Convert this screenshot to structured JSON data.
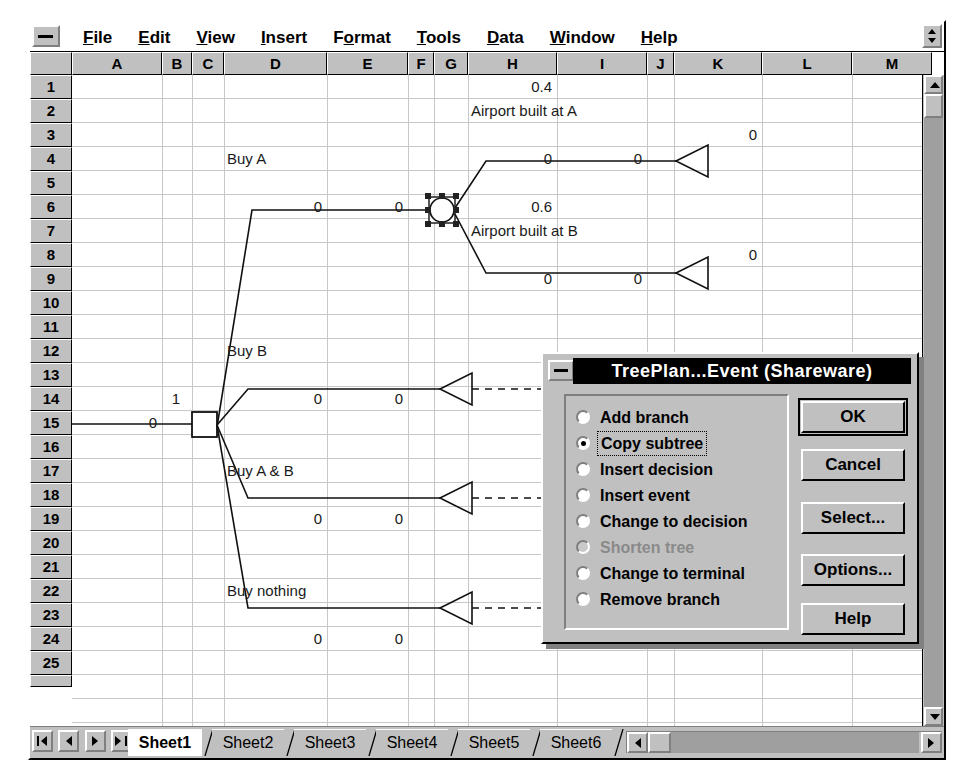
{
  "window": {
    "system_menu_icon": "minimize-bar-icon",
    "menus": [
      {
        "label": "File",
        "accel": "F"
      },
      {
        "label": "Edit",
        "accel": "E"
      },
      {
        "label": "View",
        "accel": "V"
      },
      {
        "label": "Insert",
        "accel": "I"
      },
      {
        "label": "Format",
        "accel": "o"
      },
      {
        "label": "Tools",
        "accel": "T"
      },
      {
        "label": "Data",
        "accel": "D"
      },
      {
        "label": "Window",
        "accel": "W"
      },
      {
        "label": "Help",
        "accel": "H"
      }
    ]
  },
  "grid": {
    "columns": [
      {
        "label": "A",
        "x": 42,
        "w": 90
      },
      {
        "label": "B",
        "x": 132,
        "w": 30
      },
      {
        "label": "C",
        "x": 162,
        "w": 32
      },
      {
        "label": "D",
        "x": 194,
        "w": 103
      },
      {
        "label": "E",
        "x": 297,
        "w": 81
      },
      {
        "label": "F",
        "x": 378,
        "w": 26
      },
      {
        "label": "G",
        "x": 404,
        "w": 34
      },
      {
        "label": "H",
        "x": 438,
        "w": 89
      },
      {
        "label": "I",
        "x": 527,
        "w": 90
      },
      {
        "label": "J",
        "x": 617,
        "w": 27
      },
      {
        "label": "K",
        "x": 644,
        "w": 88
      },
      {
        "label": "L",
        "x": 732,
        "w": 90
      },
      {
        "label": "M",
        "x": 822,
        "w": 80
      }
    ],
    "rows": [
      "1",
      "2",
      "3",
      "4",
      "5",
      "6",
      "7",
      "8",
      "9",
      "10",
      "11",
      "12",
      "13",
      "14",
      "15",
      "16",
      "17",
      "18",
      "19",
      "20",
      "21",
      "22",
      "23",
      "24",
      "25"
    ],
    "cells": [
      {
        "text": "0.4",
        "col": "H",
        "row": 1,
        "align": "r"
      },
      {
        "text": "Airport built at A",
        "col": "H",
        "row": 2,
        "align": "l"
      },
      {
        "text": "0",
        "col": "K",
        "row": 3,
        "align": "r"
      },
      {
        "text": "Buy A",
        "col": "D",
        "row": 4,
        "align": "l"
      },
      {
        "text": "0",
        "col": "H",
        "row": 4,
        "align": "r"
      },
      {
        "text": "0",
        "col": "I",
        "row": 4,
        "align": "r"
      },
      {
        "text": "0",
        "col": "D",
        "row": 6,
        "align": "r"
      },
      {
        "text": "0",
        "col": "E",
        "row": 6,
        "align": "r"
      },
      {
        "text": "0.6",
        "col": "H",
        "row": 6,
        "align": "r"
      },
      {
        "text": "Airport built at B",
        "col": "H",
        "row": 7,
        "align": "l"
      },
      {
        "text": "0",
        "col": "K",
        "row": 8,
        "align": "r"
      },
      {
        "text": "0",
        "col": "H",
        "row": 9,
        "align": "r"
      },
      {
        "text": "0",
        "col": "I",
        "row": 9,
        "align": "r"
      },
      {
        "text": "Buy B",
        "col": "D",
        "row": 12,
        "align": "l"
      },
      {
        "text": "1",
        "col": "B",
        "row": 14,
        "align": "c"
      },
      {
        "text": "0",
        "col": "D",
        "row": 14,
        "align": "r"
      },
      {
        "text": "0",
        "col": "E",
        "row": 14,
        "align": "r"
      },
      {
        "text": "0",
        "col": "A",
        "row": 15,
        "align": "r"
      },
      {
        "text": "Buy A & B",
        "col": "D",
        "row": 17,
        "align": "l"
      },
      {
        "text": "0",
        "col": "D",
        "row": 19,
        "align": "r"
      },
      {
        "text": "0",
        "col": "E",
        "row": 19,
        "align": "r"
      },
      {
        "text": "Buy nothing",
        "col": "D",
        "row": 22,
        "align": "l"
      },
      {
        "text": "0",
        "col": "D",
        "row": 24,
        "align": "r"
      },
      {
        "text": "0",
        "col": "E",
        "row": 24,
        "align": "r"
      }
    ]
  },
  "tree": {
    "decision_node_label": "1",
    "event_node_label": "",
    "branch_labels": [
      "Buy A",
      "Buy B",
      "Buy A & B",
      "Buy nothing"
    ],
    "event_branch_labels": [
      "Airport built at A",
      "Airport built at B"
    ],
    "probabilities": [
      "0.4",
      "0.6"
    ],
    "selected_node": "event-node"
  },
  "tabbar": {
    "nav_buttons": [
      "first-sheet-icon",
      "prev-sheet-icon",
      "next-sheet-icon",
      "last-sheet-icon"
    ],
    "sheets": [
      {
        "label": "Sheet1",
        "active": true
      },
      {
        "label": "Sheet2",
        "active": false
      },
      {
        "label": "Sheet3",
        "active": false
      },
      {
        "label": "Sheet4",
        "active": false
      },
      {
        "label": "Sheet5",
        "active": false
      },
      {
        "label": "Sheet6",
        "active": false
      }
    ]
  },
  "dialog": {
    "title": "TreePlan...Event (Shareware)",
    "system_menu_icon": "minimize-bar-icon",
    "options": [
      {
        "label": "Add branch",
        "selected": false,
        "disabled": false,
        "focused": false
      },
      {
        "label": "Copy subtree",
        "selected": true,
        "disabled": false,
        "focused": true
      },
      {
        "label": "Insert decision",
        "selected": false,
        "disabled": false,
        "focused": false
      },
      {
        "label": "Insert event",
        "selected": false,
        "disabled": false,
        "focused": false
      },
      {
        "label": "Change to decision",
        "selected": false,
        "disabled": false,
        "focused": false
      },
      {
        "label": "Shorten tree",
        "selected": false,
        "disabled": true,
        "focused": false
      },
      {
        "label": "Change to terminal",
        "selected": false,
        "disabled": false,
        "focused": false
      },
      {
        "label": "Remove branch",
        "selected": false,
        "disabled": false,
        "focused": false
      }
    ],
    "buttons": [
      {
        "label": "OK",
        "default": true
      },
      {
        "label": "Cancel",
        "default": false
      },
      {
        "label": "Select...",
        "default": false
      },
      {
        "label": "Options...",
        "default": false
      },
      {
        "label": "Help",
        "default": false
      }
    ]
  },
  "colors": {
    "face": "#c0c0c0",
    "shadow": "#7f7f7f",
    "highlight": "#ffffff",
    "titlebar": "#000000",
    "titlebar_text": "#ffffff",
    "gridline": "#c8c8c8",
    "tree_line": "#000000"
  }
}
